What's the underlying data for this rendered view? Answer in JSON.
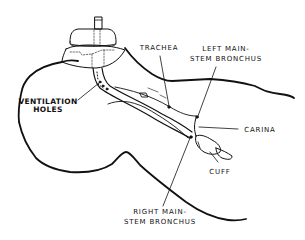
{
  "diagram": {
    "type": "anatomical illustration",
    "line_color": "#111111",
    "background": "#ffffff"
  },
  "labels": {
    "ventilation_holes": {
      "line1": "VENTILATION",
      "line2": "HOLES"
    },
    "trachea": {
      "line1": "TRACHEA"
    },
    "left_mainstem": {
      "line1": "LEFT MAIN-",
      "line2": "STEM BRONCHUS"
    },
    "carina": {
      "line1": "CARINA"
    },
    "cuff": {
      "line1": "CUFF"
    },
    "right_mainstem": {
      "line1": "RIGHT MAIN-",
      "line2": "STEM BRONCHUS"
    }
  }
}
